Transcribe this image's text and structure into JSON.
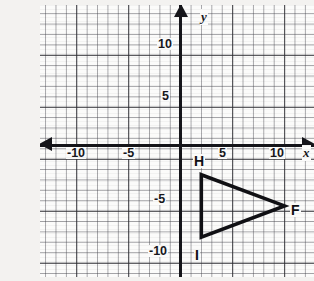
{
  "problem": {
    "label": ")"
  },
  "chart_data": {
    "type": "scatter",
    "title": "",
    "xlabel": "x",
    "ylabel": "y",
    "grid": true,
    "grid_minor_step": 1,
    "grid_major_step": 5,
    "legend": "none",
    "xlim": [
      -13,
      13
    ],
    "ylim": [
      -13,
      13
    ],
    "x_tick_labels": [
      "-10",
      "-5",
      "5",
      "10"
    ],
    "x_tick_values": [
      -10,
      -5,
      5,
      10
    ],
    "y_tick_labels": [
      "10",
      "5",
      "-5",
      "-10"
    ],
    "y_tick_values": [
      10,
      5,
      -5,
      -10
    ],
    "shapes": [
      {
        "name": "triangle-HIF",
        "type": "polygon",
        "vertices": [
          {
            "label": "H",
            "x": 2,
            "y": -3
          },
          {
            "label": "F",
            "x": 10,
            "y": -6
          },
          {
            "label": "I",
            "x": 2,
            "y": -9
          }
        ]
      }
    ],
    "annotations": [
      {
        "text": "H",
        "x": 2,
        "y": -3
      },
      {
        "text": "F",
        "x": 10,
        "y": -6
      },
      {
        "text": "I",
        "x": 2,
        "y": -9
      }
    ]
  }
}
